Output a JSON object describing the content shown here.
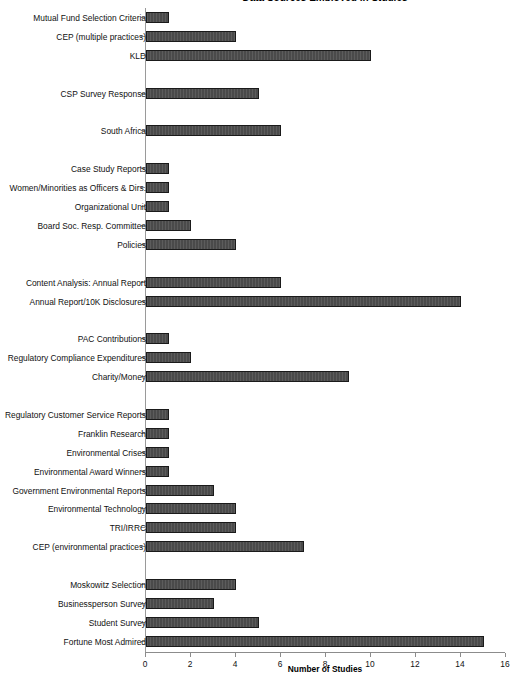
{
  "chart_data": {
    "type": "bar",
    "orientation": "horizontal",
    "title": "Data Sources Employed in Studies",
    "xlabel": "Number of Studies",
    "ylabel": "",
    "xlim": [
      0,
      16
    ],
    "xticks": [
      0,
      2,
      4,
      6,
      8,
      10,
      12,
      14,
      16
    ],
    "grid": false,
    "legend": null,
    "categories": [
      "Mutual Fund Selection Criteria",
      "CEP (multiple practices)",
      "KLD",
      "",
      "CSP Survey Response",
      "",
      "South  Africa",
      "",
      "Case Study Reports",
      "Women/Minorities as Officers & Dirs.",
      "Organizational Unit",
      "Board Soc. Resp. Committee",
      "Policies",
      "",
      "Content Analysis: Annual Report",
      "Annual Report/10K Disclosures",
      "",
      "PAC Contributions",
      "Regulatory Compliance Expenditures",
      "Charity/Money",
      "",
      "Regulatory Customer Service Reports",
      "Franklin Research",
      "Environmental Crises",
      "Environmental Award Winners",
      "Government Environmental Reports",
      "Environmental Technology",
      "TRI/IRRC",
      "CEP (environmental practices)",
      "",
      "Moskowitz Selection",
      "Businessperson Survey",
      "Student Survey",
      "Fortune Most Admired"
    ],
    "values": [
      1,
      4,
      10,
      null,
      5,
      null,
      6,
      null,
      1,
      1,
      1,
      2,
      4,
      null,
      6,
      14,
      null,
      1,
      2,
      9,
      null,
      1,
      1,
      1,
      1,
      3,
      4,
      4,
      7,
      null,
      4,
      3,
      5,
      15
    ]
  },
  "colors": {
    "bar_fill": "#4a4a4a",
    "bar_stroke": "#1a1a1a",
    "axis": "#8c8c8c",
    "text": "#111111",
    "background": "#ffffff"
  }
}
